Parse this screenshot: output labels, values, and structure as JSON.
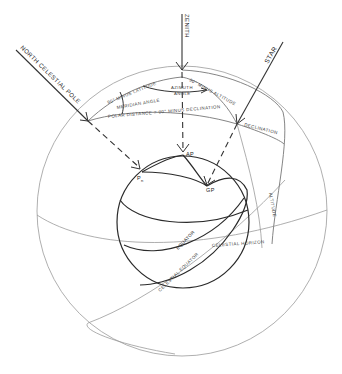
{
  "diagram": {
    "rays": {
      "north_celestial_pole": "NORTH CELESTIAL POLE",
      "zenith": "ZENITH",
      "star": "STAR"
    },
    "celestial_triangle": {
      "side_pole_zenith": "90° MINUS LATITUDE",
      "side_zenith_star": "90° MINUS ALTITUDE",
      "side_pole_star": "POLAR DISTANCE = 90° MINUS DECLINATION",
      "meridian_angle": "MERIDIAN ANGLE",
      "azimuth_angle_line1": "AZIMUTH",
      "azimuth_angle_line2": "ANGLE"
    },
    "arcs": {
      "declination": "DECLINATION",
      "altitude": "ALTITUDE",
      "celestial_horizon": "CELESTIAL HORIZON",
      "celestial_equator": "CELESTIAL EQUATOR",
      "equator": "EQUATOR"
    },
    "earth_points": {
      "pn": "P",
      "pn_sub": "n",
      "ap": "AP",
      "gp": "GP"
    }
  }
}
